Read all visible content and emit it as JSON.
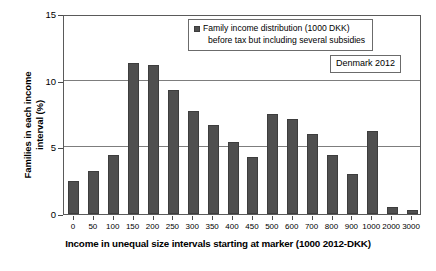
{
  "chart_data": {
    "type": "bar",
    "title": "",
    "xlabel": "Income in unequal size intervals starting at marker (1000 2012-DKK)",
    "ylabel_line1": "Families in each income",
    "ylabel_line2": "interval (%)",
    "categories": [
      "0",
      "50",
      "100",
      "150",
      "200",
      "250",
      "300",
      "350",
      "400",
      "450",
      "500",
      "600",
      "700",
      "800",
      "900",
      "1000",
      "2000",
      "3000"
    ],
    "values": [
      2.5,
      3.2,
      4.4,
      11.3,
      11.2,
      9.3,
      7.7,
      6.7,
      5.4,
      4.3,
      7.5,
      7.1,
      6.0,
      4.4,
      3.0,
      6.2,
      0.5,
      0.3
    ],
    "series": [
      {
        "name": "Family income distribution (1000 DKK) before tax but including several subsidies",
        "values": [
          2.5,
          3.2,
          4.4,
          11.3,
          11.2,
          9.3,
          7.7,
          6.7,
          5.4,
          4.3,
          7.5,
          7.1,
          6.0,
          4.4,
          3.0,
          6.2,
          0.5,
          0.3
        ]
      }
    ],
    "ylim": [
      0,
      15
    ],
    "yticks": [
      "0",
      "5",
      "10",
      "15"
    ],
    "ytick_values": [
      0,
      5,
      10,
      15
    ],
    "grid": true,
    "legend_position": "top-center",
    "bar_color": "#4f4f4f",
    "gridline_color": "#7d7d7d",
    "frame_color": "#5a5a5a"
  },
  "legend": {
    "line1": "Family income distribution (1000 DKK)",
    "line2": "before tax but including several subsidies"
  },
  "annotation": {
    "text": "Denmark 2012"
  }
}
